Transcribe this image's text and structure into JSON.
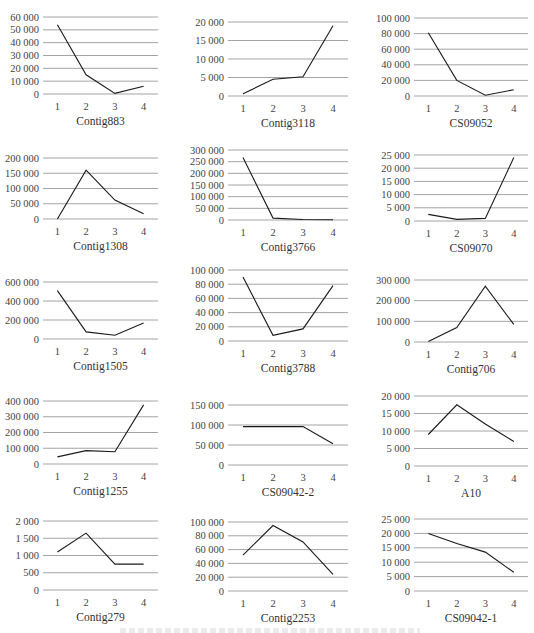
{
  "chart_data": [
    {
      "type": "line",
      "title": "Contig883",
      "categories": [
        "1",
        "2",
        "3",
        "4"
      ],
      "values": [
        54000,
        15000,
        500,
        6000
      ],
      "yticks": [
        0,
        10000,
        20000,
        30000,
        40000,
        50000,
        60000
      ],
      "ytick_labels": [
        "0",
        "10 000",
        "20 000",
        "30 000",
        "40 000",
        "50 000",
        "60 000"
      ],
      "ylim": [
        0,
        60000
      ],
      "grid": true,
      "legend": "none"
    },
    {
      "type": "line",
      "title": "Contig3118",
      "categories": [
        "1",
        "2",
        "3",
        "4"
      ],
      "values": [
        600,
        4500,
        5200,
        19000
      ],
      "yticks": [
        0,
        5000,
        10000,
        15000,
        20000
      ],
      "ytick_labels": [
        "0",
        "5 000",
        "10 000",
        "15 000",
        "20 000"
      ],
      "ylim": [
        0,
        20000
      ],
      "grid": true,
      "legend": "none"
    },
    {
      "type": "line",
      "title": "CS09052",
      "categories": [
        "1",
        "2",
        "3",
        "4"
      ],
      "values": [
        81000,
        20000,
        1000,
        8000
      ],
      "yticks": [
        0,
        20000,
        40000,
        60000,
        80000,
        100000
      ],
      "ytick_labels": [
        "0",
        "20 000",
        "40 000",
        "60 000",
        "80 000",
        "100 000"
      ],
      "ylim": [
        0,
        100000
      ],
      "grid": true,
      "legend": "none"
    },
    {
      "type": "line",
      "title": "Contig1308",
      "categories": [
        "1",
        "2",
        "3",
        "4"
      ],
      "values": [
        0,
        160000,
        62000,
        17000
      ],
      "yticks": [
        0,
        50000,
        100000,
        150000,
        200000
      ],
      "ytick_labels": [
        "0",
        "50 000",
        "100 000",
        "150 000",
        "200 000"
      ],
      "ylim": [
        0,
        200000
      ],
      "grid": true,
      "legend": "none"
    },
    {
      "type": "line",
      "title": "Contig3766",
      "categories": [
        "1",
        "2",
        "3",
        "4"
      ],
      "values": [
        268000,
        8000,
        2000,
        1000
      ],
      "yticks": [
        0,
        50000,
        100000,
        150000,
        200000,
        250000,
        300000
      ],
      "ytick_labels": [
        "0",
        "50 000",
        "100 000",
        "150 000",
        "200 000",
        "250 000",
        "300 000"
      ],
      "ylim": [
        0,
        300000
      ],
      "grid": true,
      "legend": "none"
    },
    {
      "type": "line",
      "title": "CS09070",
      "categories": [
        "1",
        "2",
        "3",
        "4"
      ],
      "values": [
        2500,
        600,
        1000,
        24000
      ],
      "yticks": [
        0,
        5000,
        10000,
        15000,
        20000,
        25000
      ],
      "ytick_labels": [
        "0",
        "5 000",
        "10 000",
        "15 000",
        "20 000",
        "25 000"
      ],
      "ylim": [
        0,
        25000
      ],
      "grid": true,
      "legend": "none"
    },
    {
      "type": "line",
      "title": "Contig1505",
      "categories": [
        "1",
        "2",
        "3",
        "4"
      ],
      "values": [
        510000,
        75000,
        40000,
        170000
      ],
      "yticks": [
        0,
        200000,
        400000,
        600000
      ],
      "ytick_labels": [
        "0",
        "200 000",
        "400 000",
        "600 000"
      ],
      "ylim": [
        0,
        600000
      ],
      "grid": true,
      "legend": "none"
    },
    {
      "type": "line",
      "title": "Contig3788",
      "categories": [
        "1",
        "2",
        "3",
        "4"
      ],
      "values": [
        90000,
        8000,
        17000,
        78000
      ],
      "yticks": [
        0,
        20000,
        40000,
        60000,
        80000,
        100000
      ],
      "ytick_labels": [
        "0",
        "20 000",
        "40 000",
        "60 000",
        "80 000",
        "100 000"
      ],
      "ylim": [
        0,
        100000
      ],
      "grid": true,
      "legend": "none"
    },
    {
      "type": "line",
      "title": "Contig706",
      "categories": [
        "1",
        "2",
        "3",
        "4"
      ],
      "values": [
        2000,
        70000,
        270000,
        85000
      ],
      "yticks": [
        0,
        100000,
        200000,
        300000
      ],
      "ytick_labels": [
        "0",
        "100 000",
        "200 000",
        "300 000"
      ],
      "ylim": [
        0,
        300000
      ],
      "grid": true,
      "legend": "none"
    },
    {
      "type": "line",
      "title": "Contig1255",
      "categories": [
        "1",
        "2",
        "3",
        "4"
      ],
      "values": [
        45000,
        85000,
        78000,
        375000
      ],
      "yticks": [
        0,
        100000,
        200000,
        300000,
        400000
      ],
      "ytick_labels": [
        "0",
        "100 000",
        "200 000",
        "300 000",
        "400 000"
      ],
      "ylim": [
        0,
        400000
      ],
      "grid": true,
      "legend": "none"
    },
    {
      "type": "line",
      "title": "CS09042-2",
      "categories": [
        "1",
        "2",
        "3",
        "4"
      ],
      "values": [
        96000,
        96000,
        96000,
        53000
      ],
      "yticks": [
        0,
        50000,
        100000,
        150000
      ],
      "ytick_labels": [
        "0",
        "50 000",
        "100 000",
        "150 000"
      ],
      "ylim": [
        0,
        150000
      ],
      "grid": true,
      "legend": "none"
    },
    {
      "type": "line",
      "title": "A10",
      "categories": [
        "1",
        "2",
        "3",
        "4"
      ],
      "values": [
        9000,
        17500,
        12000,
        7000
      ],
      "yticks": [
        0,
        5000,
        10000,
        15000,
        20000
      ],
      "ytick_labels": [
        "0",
        "5 000",
        "10 000",
        "15 000",
        "20 000"
      ],
      "ylim": [
        0,
        20000
      ],
      "grid": true,
      "legend": "none"
    },
    {
      "type": "line",
      "title": "Contig279",
      "categories": [
        "1",
        "2",
        "3",
        "4"
      ],
      "values": [
        1100,
        1650,
        750,
        750
      ],
      "yticks": [
        0,
        500,
        1000,
        1500,
        2000
      ],
      "ytick_labels": [
        "0",
        "500",
        "1 000",
        "1 500",
        "2 000"
      ],
      "ylim": [
        0,
        2000
      ],
      "grid": true,
      "legend": "none"
    },
    {
      "type": "line",
      "title": "Contig2253",
      "categories": [
        "1",
        "2",
        "3",
        "4"
      ],
      "values": [
        52000,
        95000,
        71000,
        24000
      ],
      "yticks": [
        0,
        20000,
        40000,
        60000,
        80000,
        100000
      ],
      "ytick_labels": [
        "0",
        "20 000",
        "40 000",
        "60 000",
        "80 000",
        "100 000"
      ],
      "ylim": [
        0,
        100000
      ],
      "grid": true,
      "legend": "none"
    },
    {
      "type": "line",
      "title": "CS09042-1",
      "categories": [
        "1",
        "2",
        "3",
        "4"
      ],
      "values": [
        20000,
        16500,
        13500,
        6500
      ],
      "yticks": [
        0,
        5000,
        10000,
        15000,
        20000,
        25000
      ],
      "ytick_labels": [
        "0",
        "5 000",
        "10 000",
        "15 000",
        "20 000",
        "25 000"
      ],
      "ylim": [
        0,
        25000
      ],
      "grid": true,
      "legend": "none"
    }
  ],
  "layout": {
    "columns": 3,
    "rows": 5,
    "panels": [
      {
        "left": 0,
        "top": 0,
        "plot_left": 43,
        "plot_right": 158,
        "plot_top": 17,
        "plot_bottom": 94
      },
      {
        "left": 178,
        "top": 0,
        "plot_left": 228,
        "plot_right": 348,
        "plot_top": 22,
        "plot_bottom": 96
      },
      {
        "left": 356,
        "top": 0,
        "plot_left": 414,
        "plot_right": 528,
        "plot_top": 18,
        "plot_bottom": 96
      },
      {
        "left": 0,
        "top": 125,
        "plot_left": 43,
        "plot_right": 158,
        "plot_top": 158,
        "plot_bottom": 219
      },
      {
        "left": 178,
        "top": 125,
        "plot_left": 228,
        "plot_right": 348,
        "plot_top": 150,
        "plot_bottom": 220
      },
      {
        "left": 356,
        "top": 125,
        "plot_left": 414,
        "plot_right": 528,
        "plot_top": 155,
        "plot_bottom": 221
      },
      {
        "left": 0,
        "top": 255,
        "plot_left": 43,
        "plot_right": 158,
        "plot_top": 282,
        "plot_bottom": 339
      },
      {
        "left": 178,
        "top": 255,
        "plot_left": 228,
        "plot_right": 348,
        "plot_top": 270,
        "plot_bottom": 341
      },
      {
        "left": 356,
        "top": 255,
        "plot_left": 414,
        "plot_right": 528,
        "plot_top": 280,
        "plot_bottom": 342
      },
      {
        "left": 0,
        "top": 375,
        "plot_left": 43,
        "plot_right": 158,
        "plot_top": 401,
        "plot_bottom": 464
      },
      {
        "left": 178,
        "top": 375,
        "plot_left": 228,
        "plot_right": 348,
        "plot_top": 405,
        "plot_bottom": 465
      },
      {
        "left": 356,
        "top": 375,
        "plot_left": 414,
        "plot_right": 528,
        "plot_top": 396,
        "plot_bottom": 466
      },
      {
        "left": 0,
        "top": 495,
        "plot_left": 43,
        "plot_right": 158,
        "plot_top": 521,
        "plot_bottom": 590
      },
      {
        "left": 178,
        "top": 495,
        "plot_left": 228,
        "plot_right": 348,
        "plot_top": 522,
        "plot_bottom": 591
      },
      {
        "left": 356,
        "top": 495,
        "plot_left": 414,
        "plot_right": 528,
        "plot_top": 519,
        "plot_bottom": 591
      }
    ]
  }
}
